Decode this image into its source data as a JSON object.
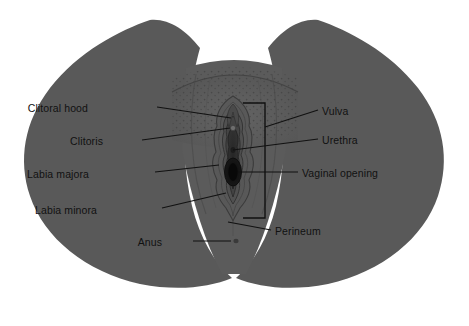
{
  "figure": {
    "colors": {
      "background": "#ffffff",
      "body": "#595959",
      "body_shadow": "#4f4f4f",
      "mound": "#5d5d5d",
      "stipple": "#4a4a4a",
      "labia_majora": "#545454",
      "labia_minora_outer": "#4d4d4d",
      "labia_minora_inner": "#3f3f3f",
      "vestibule": "#2e2e2e",
      "vaginal_opening": "#121212",
      "leader_line": "#111111",
      "label_text": "#111111"
    },
    "labels": [
      {
        "id": "clitoral-hood",
        "text": "Clitoral hood",
        "side": "left",
        "x": 88,
        "y": 102
      },
      {
        "id": "clitoris",
        "text": "Clitoris",
        "side": "left",
        "x": 103,
        "y": 135
      },
      {
        "id": "labia-majora",
        "text": "Labia majora",
        "side": "left",
        "x": 89,
        "y": 168
      },
      {
        "id": "labia-minora",
        "text": "Labia minora",
        "side": "left",
        "x": 97,
        "y": 204
      },
      {
        "id": "anus",
        "text": "Anus",
        "side": "left",
        "x": 162,
        "y": 236
      },
      {
        "id": "vulva",
        "text": "Vulva",
        "side": "right",
        "x": 322,
        "y": 106
      },
      {
        "id": "urethra",
        "text": "Urethra",
        "side": "right",
        "x": 322,
        "y": 135
      },
      {
        "id": "vaginal-opening",
        "text": "Vaginal opening",
        "side": "right",
        "x": 302,
        "y": 168
      },
      {
        "id": "perineum",
        "text": "Perineum",
        "side": "right",
        "x": 275,
        "y": 226
      }
    ],
    "bracket": {
      "name": "vulva-bracket",
      "x": 265,
      "y_top": 103,
      "y_bottom": 218,
      "arm": 22
    }
  }
}
